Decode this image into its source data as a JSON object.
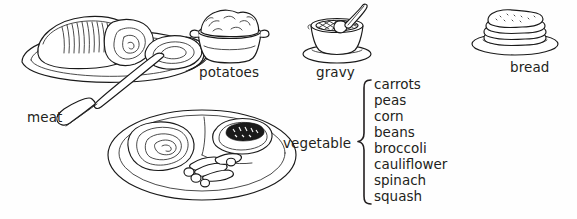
{
  "diagram": {
    "background_color": "#fefefe",
    "ink_color": "#1a1a1a",
    "labels": {
      "meat": "meat",
      "potatoes": "potatoes",
      "gravy": "gravy",
      "bread": "bread",
      "vegetable": "vegetable"
    },
    "vegetable_options": [
      "carrots",
      "peas",
      "corn",
      "beans",
      "broccoli",
      "cauliflower",
      "spinach",
      "squash"
    ],
    "illustrations": [
      {
        "name": "roast-meat-platter",
        "label": "meat"
      },
      {
        "name": "potatoes-bowl",
        "label": "potatoes"
      },
      {
        "name": "gravy-boat",
        "label": "gravy"
      },
      {
        "name": "bread-stack",
        "label": "bread"
      },
      {
        "name": "dinner-plate",
        "label": ""
      }
    ]
  }
}
